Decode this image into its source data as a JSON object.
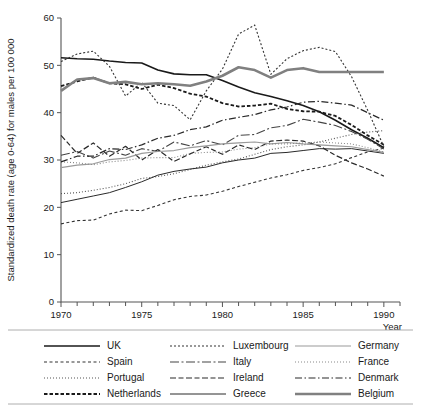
{
  "chart_data": {
    "type": "line",
    "title": "",
    "xlabel": "Year",
    "ylabel": "Standardized death rate (age 0-64) for males per 100 000",
    "xlim": [
      1970,
      1991
    ],
    "ylim": [
      0,
      60
    ],
    "xticks": [
      1970,
      1975,
      1980,
      1985,
      1990
    ],
    "xtick_labels": [
      "1970",
      "1975",
      "1980",
      "1985",
      "1990"
    ],
    "yticks": [
      0,
      10,
      20,
      30,
      40,
      50,
      60
    ],
    "ytick_labels": [
      "0",
      "10",
      "20",
      "30",
      "40",
      "50",
      "60"
    ],
    "x_minor_tick_step": 1,
    "grid": false,
    "legend_position": "below-axes",
    "legend_columns": 3,
    "x": [
      1970,
      1971,
      1972,
      1973,
      1974,
      1975,
      1976,
      1977,
      1978,
      1979,
      1980,
      1981,
      1982,
      1983,
      1984,
      1985,
      1986,
      1987,
      1988,
      1989,
      1990
    ],
    "series": [
      {
        "name": "UK",
        "style": "solid",
        "color": "#1a1a1a",
        "width": 1.6,
        "values": [
          51.6,
          51.4,
          51.3,
          50.9,
          50.6,
          50.5,
          49.0,
          48.2,
          48.0,
          48.0,
          46.8,
          45.4,
          44.2,
          43.4,
          42.5,
          41.5,
          40.2,
          38.4,
          36.4,
          34.6,
          32.6
        ]
      },
      {
        "name": "Spain",
        "style": "dash-small",
        "color": "#333333",
        "width": 1.1,
        "values": [
          16.5,
          17.2,
          17.3,
          18.6,
          19.4,
          19.3,
          20.4,
          21.6,
          22.3,
          22.6,
          23.4,
          24.4,
          25.3,
          26.2,
          26.9,
          27.8,
          28.4,
          29.2,
          30.5,
          31.7,
          32.5
        ]
      },
      {
        "name": "Portugal",
        "style": "dotted",
        "color": "#555555",
        "width": 1.1,
        "values": [
          22.9,
          23.1,
          23.6,
          24.2,
          25.0,
          26.1,
          26.5,
          27.1,
          28.0,
          28.9,
          29.6,
          30.2,
          31.2,
          32.2,
          32.8,
          33.2,
          33.8,
          34.6,
          35.4,
          35.9,
          36.2
        ]
      },
      {
        "name": "Netherlands",
        "style": "dash-thick",
        "color": "#1a1a1a",
        "width": 1.8,
        "values": [
          45.6,
          46.6,
          47.4,
          46.2,
          46.0,
          45.0,
          45.9,
          45.2,
          44.0,
          43.4,
          42.0,
          41.3,
          41.5,
          41.9,
          40.8,
          40.3,
          40.2,
          39.3,
          37.4,
          35.2,
          33.2
        ]
      },
      {
        "name": "Luxembourg",
        "style": "dotted-fine",
        "color": "#333333",
        "width": 1.1,
        "values": [
          50.8,
          52.4,
          53.0,
          49.8,
          43.5,
          46.4,
          42.0,
          41.5,
          38.5,
          44.6,
          49.2,
          56.6,
          58.5,
          48.1,
          51.4,
          53.1,
          53.8,
          52.9,
          47.6,
          40.5,
          32.8
        ]
      },
      {
        "name": "Italy",
        "style": "dashdot-long",
        "color": "#444444",
        "width": 1.1,
        "values": [
          31.0,
          31.8,
          30.4,
          31.9,
          31.0,
          32.4,
          31.8,
          33.8,
          33.0,
          34.1,
          33.2,
          35.2,
          35.4,
          36.8,
          37.3,
          38.6,
          38.0,
          37.3,
          36.0,
          34.4,
          32.3
        ]
      },
      {
        "name": "Ireland",
        "style": "dashdot-mixed",
        "color": "#2a2a2a",
        "width": 1.2,
        "values": [
          35.2,
          31.4,
          33.6,
          30.8,
          32.9,
          30.0,
          32.2,
          29.7,
          31.3,
          32.8,
          31.2,
          33.2,
          32.2,
          34.0,
          34.2,
          34.0,
          33.0,
          31.0,
          29.4,
          28.1,
          26.6
        ]
      },
      {
        "name": "Greece",
        "style": "solid-thin",
        "color": "#2a2a2a",
        "width": 1.0,
        "values": [
          21.0,
          21.7,
          22.4,
          23.1,
          24.2,
          25.4,
          26.8,
          27.6,
          28.1,
          28.5,
          29.4,
          30.0,
          30.4,
          31.4,
          31.6,
          32.0,
          32.4,
          32.3,
          32.4,
          31.9,
          31.4
        ]
      },
      {
        "name": "Germany",
        "style": "solid-grey",
        "color": "#9a9a9a",
        "width": 1.2,
        "values": [
          28.4,
          28.9,
          29.2,
          30.1,
          30.4,
          31.4,
          31.8,
          32.0,
          32.6,
          33.0,
          33.4,
          33.6,
          33.8,
          33.4,
          33.7,
          33.4,
          33.2,
          33.0,
          32.8,
          32.2,
          31.6
        ]
      },
      {
        "name": "France",
        "style": "dotted-grey",
        "color": "#8a8a8a",
        "width": 1.1,
        "values": [
          29.6,
          29.4,
          29.0,
          29.6,
          29.9,
          30.4,
          30.5,
          30.5,
          31.4,
          31.6,
          31.7,
          32.3,
          32.6,
          33.4,
          33.4,
          33.6,
          33.8,
          33.6,
          33.4,
          32.6,
          31.7
        ]
      },
      {
        "name": "Denmark",
        "style": "dashdot",
        "color": "#2a2a2a",
        "width": 1.2,
        "values": [
          29.6,
          30.8,
          30.8,
          32.4,
          32.2,
          33.2,
          34.6,
          35.2,
          36.4,
          37.0,
          38.4,
          39.0,
          39.6,
          40.6,
          41.2,
          42.2,
          42.4,
          42.0,
          41.6,
          40.0,
          38.4
        ]
      },
      {
        "name": "Belgium",
        "style": "solid-heavy-grey",
        "color": "#808080",
        "width": 2.6,
        "values": [
          44.6,
          47.0,
          47.3,
          46.2,
          46.5,
          46.0,
          46.2,
          46.0,
          45.7,
          46.6,
          47.8,
          49.6,
          49.0,
          47.4,
          49.0,
          49.4,
          48.6,
          48.6,
          48.6,
          48.6,
          48.6
        ]
      }
    ]
  },
  "axes": {
    "ylabel": "Standardized death rate (age 0-64) for males per 100 000",
    "xlabel": "Year",
    "ytick_labels": [
      "0",
      "10",
      "20",
      "30",
      "40",
      "50",
      "60"
    ],
    "xtick_labels": [
      "1970",
      "1975",
      "1980",
      "1985",
      "1990"
    ]
  },
  "legend": {
    "columns": [
      {
        "items": [
          {
            "label": "UK",
            "style": "solid"
          },
          {
            "label": "Spain",
            "style": "dash-small"
          },
          {
            "label": "Portugal",
            "style": "dotted"
          },
          {
            "label": "Netherlands",
            "style": "dash-thick"
          }
        ]
      },
      {
        "items": [
          {
            "label": "Luxembourg",
            "style": "dotted-fine"
          },
          {
            "label": "Italy",
            "style": "dashdot-long"
          },
          {
            "label": "Ireland",
            "style": "dashdot-mixed"
          },
          {
            "label": "Greece",
            "style": "solid-thin"
          }
        ]
      },
      {
        "items": [
          {
            "label": "Germany",
            "style": "solid-grey"
          },
          {
            "label": "France",
            "style": "dotted-grey"
          },
          {
            "label": "Denmark",
            "style": "dashdot"
          },
          {
            "label": "Belgium",
            "style": "solid-heavy-grey"
          }
        ]
      }
    ]
  }
}
